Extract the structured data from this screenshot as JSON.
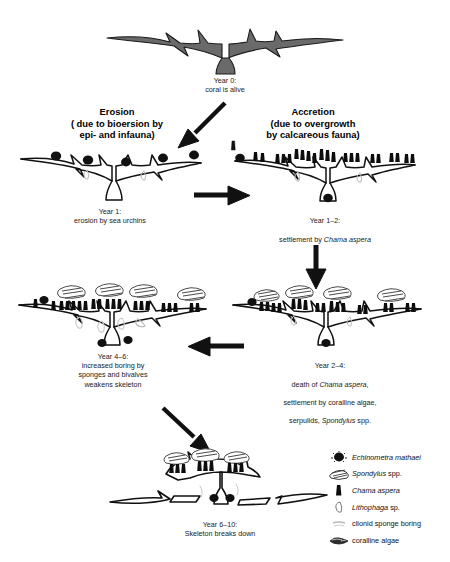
{
  "figure": {
    "title_visible": false,
    "background": "#ffffff",
    "ink": "#000000",
    "coral_live_fill": "#666666"
  },
  "headings": [
    {
      "id": "erosion",
      "label": "Erosion\n( due to bioersion by\nepi- and infauna)"
    },
    {
      "id": "accretion",
      "label": "Accretion\n(due to overgrowth\nby calcareous fauna)"
    }
  ],
  "stages": [
    {
      "id": "year-0",
      "caption": "Year 0:\ncoral is alive"
    },
    {
      "id": "year-1",
      "caption": "Year 1:\nerosion by sea urchins"
    },
    {
      "id": "year-1-2",
      "caption_line1": "Year 1–2:",
      "caption_line2_pre": "settlement by ",
      "caption_line2_italic": "Chama aspera"
    },
    {
      "id": "year-2-4",
      "caption_line1": "Year 2–4:",
      "caption_line2_pre": "death of ",
      "caption_line2_italic": "Chama aspera",
      "caption_line2_post": ",",
      "caption_line3": "settlement by coralline algae,",
      "caption_line4_pre": "serpulids, ",
      "caption_line4_italic": "Spondylus",
      "caption_line4_post": " spp."
    },
    {
      "id": "year-4-6",
      "caption": "Year 4–6:\nincreased boring by\nsponges and bivalves\nweakens skeleton"
    },
    {
      "id": "year-6-10",
      "caption": "Year 6–10:\nSkeleton breaks down"
    }
  ],
  "arrows": [
    {
      "id": "arrow-year0-to-year1",
      "direction": "down-left"
    },
    {
      "id": "arrow-year1-to-year1-2",
      "direction": "right"
    },
    {
      "id": "arrow-year1-2-to-year2-4",
      "direction": "down"
    },
    {
      "id": "arrow-year2-4-to-year4-6",
      "direction": "left"
    },
    {
      "id": "arrow-year4-6-to-year6-10",
      "direction": "down-right"
    }
  ],
  "legend": {
    "items": [
      {
        "icon": "sea-urchin-icon",
        "name_italic": "Echinometra mathaei",
        "name_plain": ""
      },
      {
        "icon": "spondylus-shell-icon",
        "name_italic": "Spondylus",
        "name_plain": " spp."
      },
      {
        "icon": "chama-shell-icon",
        "name_italic": "Chama aspera",
        "name_plain": ""
      },
      {
        "icon": "lithophaga-icon",
        "name_italic": "Lithophaga",
        "name_plain": " sp."
      },
      {
        "icon": "clionid-boring-icon",
        "name_italic": "",
        "name_plain": "clionid sponge boring"
      },
      {
        "icon": "coralline-algae-icon",
        "name_italic": "",
        "name_plain": "coralline algae"
      }
    ]
  }
}
